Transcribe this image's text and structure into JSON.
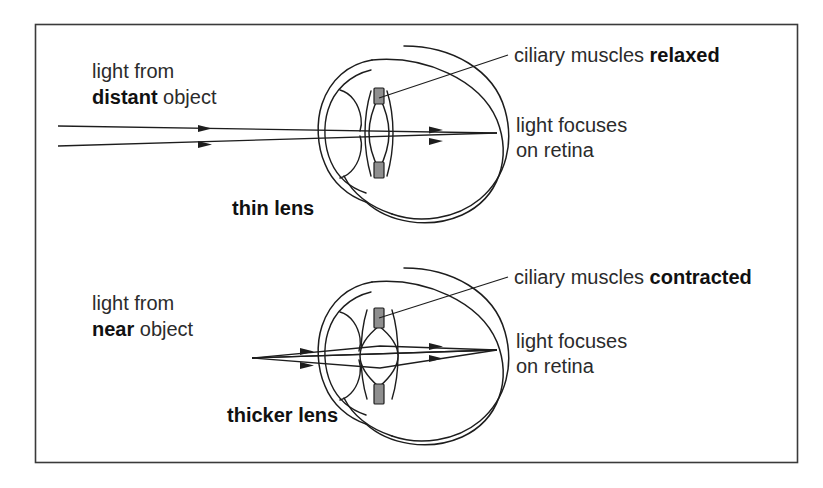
{
  "figure": {
    "frame_color": "#3a3a3a",
    "line_color": "#1d1d1d",
    "muscle_fill": "#8f8f8f",
    "text_color": "#2b2b2b",
    "background": "#ffffff"
  },
  "panels": [
    {
      "id": "distant",
      "source_label_line1": "light from",
      "source_label_bold": "distant",
      "source_label_rest": " object",
      "lens_label": "thin lens",
      "muscle_label_plain": "ciliary muscles ",
      "muscle_label_bold": "relaxed",
      "focus_label_line1": "light focuses",
      "focus_label_line2": "on retina",
      "ray_type": "parallel",
      "lens_shape": "thin"
    },
    {
      "id": "near",
      "source_label_line1": "light from",
      "source_label_bold": "near",
      "source_label_rest": " object",
      "lens_label": "thicker lens",
      "muscle_label_plain": "ciliary muscles ",
      "muscle_label_bold": "contracted",
      "focus_label_line1": "light focuses",
      "focus_label_line2": "on retina",
      "ray_type": "diverging",
      "lens_shape": "thick"
    }
  ]
}
